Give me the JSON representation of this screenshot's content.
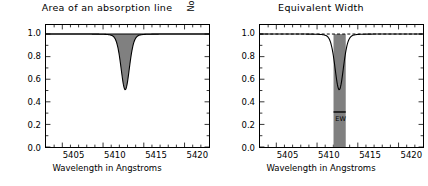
{
  "figure": {
    "width": 428,
    "height": 186,
    "background": "#ffffff",
    "fill_color": "#808080",
    "line_color": "#000000"
  },
  "panels": [
    {
      "id": "area",
      "title": "Area of an absorption line",
      "continuum_style": "solid",
      "shading": "under-continuum-over-profile"
    },
    {
      "id": "equivalent-width",
      "title": "Equivalent Width",
      "continuum_style": "dashed",
      "shading": "rectangle",
      "annotation": {
        "label": "EW",
        "bar_y": 0.31,
        "x_start": 5412.02,
        "x_end": 5413.52
      }
    }
  ],
  "axes": {
    "xlabel": "Wavelength in Angstroms",
    "ylabel": "Normalized flux",
    "xlim": [
      5403.0,
      5423.0
    ],
    "ylim": [
      0.0,
      1.08
    ],
    "xticks": [
      5405,
      5410,
      5415,
      5420
    ],
    "xticklabels": [
      "5405",
      "5410",
      "5415",
      "5420"
    ],
    "yticks": [
      0.0,
      0.2,
      0.4,
      0.6,
      0.8,
      1.0
    ],
    "yticklabels": [
      "0.0",
      "0.2",
      "0.4",
      "0.6",
      "0.8",
      "1.0"
    ],
    "minor_xticks_per_interval": 5,
    "minor_yticks_per_interval": 2,
    "grid": false
  },
  "chart_data": {
    "type": "line",
    "xlabel": "Wavelength in Angstroms",
    "ylabel": "Normalized flux",
    "xlim": [
      5403.0,
      5423.0
    ],
    "ylim": [
      0.0,
      1.08
    ],
    "grid": false,
    "legend": null,
    "profile": {
      "name": "Normalized flux",
      "model": "voigt-absorption",
      "continuum": 1.0,
      "line_center": 5412.72,
      "depth": 0.52,
      "min_flux": 0.48,
      "gauss_sigma": 0.52,
      "lorentz_gamma": 0.95
    },
    "x": [
      5403.0,
      5404.0,
      5405.0,
      5406.0,
      5407.0,
      5407.8,
      5408.6,
      5409.4,
      5410.0,
      5410.5,
      5411.0,
      5411.4,
      5411.8,
      5412.1,
      5412.4,
      5412.72,
      5413.0,
      5413.3,
      5413.7,
      5414.1,
      5414.6,
      5415.2,
      5415.8,
      5416.6,
      5417.4,
      5418.4,
      5419.4,
      5420.4,
      5421.4,
      5422.4,
      5423.0
    ],
    "y": [
      0.995,
      0.994,
      0.993,
      0.991,
      0.988,
      0.985,
      0.979,
      0.968,
      0.955,
      0.938,
      0.907,
      0.868,
      0.795,
      0.7,
      0.575,
      0.482,
      0.52,
      0.62,
      0.762,
      0.851,
      0.91,
      0.944,
      0.96,
      0.974,
      0.981,
      0.987,
      0.99,
      0.992,
      0.993,
      0.994,
      0.995
    ],
    "shaded_area": {
      "panel": "area",
      "between": [
        "continuum=1.0",
        "profile"
      ],
      "color": "#808080"
    },
    "equivalent_width_box": {
      "panel": "equivalent-width",
      "x_start": 5412.02,
      "x_end": 5413.52,
      "y_start": 0.0,
      "y_end": 1.0,
      "width_angstroms": 1.5,
      "color": "#808080",
      "label": "EW"
    }
  }
}
